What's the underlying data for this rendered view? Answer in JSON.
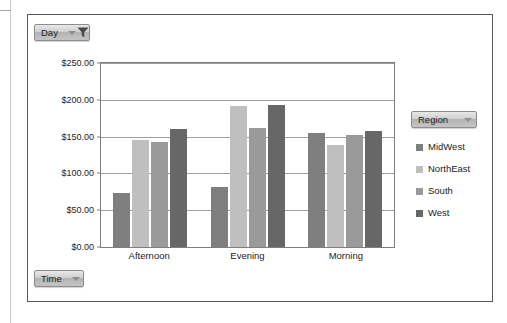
{
  "panel": {
    "day_filter": {
      "label": "Day",
      "icon": "funnel-filter-icon",
      "has_caret": true
    },
    "time_filter": {
      "label": "Time",
      "icon": "chevron-down-icon",
      "has_caret": true
    },
    "region_filter": {
      "label": "Region",
      "icon": "chevron-down-icon",
      "has_caret": true
    }
  },
  "legend": {
    "title": "Region",
    "items": [
      {
        "label": "MidWest",
        "color": "#7f7f7f"
      },
      {
        "label": "NorthEast",
        "color": "#bfbfbf"
      },
      {
        "label": "South",
        "color": "#9a9a9a"
      },
      {
        "label": "West",
        "color": "#676767"
      }
    ]
  },
  "chart_data": {
    "type": "bar",
    "title": "",
    "xlabel": "",
    "ylabel": "",
    "categories": [
      "Afternoon",
      "Evening",
      "Morning"
    ],
    "series": [
      {
        "name": "MidWest",
        "color": "#7f7f7f",
        "values": [
          73,
          82,
          155
        ]
      },
      {
        "name": "NorthEast",
        "color": "#bfbfbf",
        "values": [
          146,
          191,
          138
        ]
      },
      {
        "name": "South",
        "color": "#9a9a9a",
        "values": [
          143,
          162,
          152
        ]
      },
      {
        "name": "West",
        "color": "#676767",
        "values": [
          160,
          193,
          157
        ]
      }
    ],
    "ylim": [
      0,
      250
    ],
    "ytick_values": [
      0,
      50,
      100,
      150,
      200,
      250
    ],
    "ytick_labels": [
      "$0.00",
      "$50.00",
      "$100.00",
      "$150.00",
      "$200.00",
      "$250.00"
    ],
    "grid": true,
    "legend_position": "right"
  }
}
